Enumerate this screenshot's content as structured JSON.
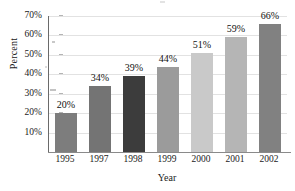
{
  "chart_data": {
    "type": "bar",
    "title": "",
    "xlabel": "Year",
    "ylabel": "Percent",
    "categories": [
      "1995",
      "1997",
      "1998",
      "1999",
      "2000",
      "2001",
      "2002"
    ],
    "values": [
      20,
      34,
      39,
      44,
      51,
      59,
      66
    ],
    "value_labels": [
      "20%",
      "34%",
      "39%",
      "44%",
      "51%",
      "59%",
      "66%"
    ],
    "ylim": [
      0,
      70
    ],
    "ytick_values": [
      10,
      20,
      30,
      40,
      50,
      60,
      70
    ],
    "ytick_labels": [
      "10%",
      "20%",
      "30%",
      "40%",
      "50%",
      "60%",
      "70%"
    ],
    "grid": "horizontal",
    "legend": "none",
    "bar_colors": [
      "#7d7d7d",
      "#747474",
      "#3c3c3c",
      "#9b9b9b",
      "#c9c9c9",
      "#b5b5b5",
      "#818181"
    ],
    "grid_color": "#e2e2e2",
    "axis_color": "#6a6a6a",
    "background": "#ffffff"
  }
}
